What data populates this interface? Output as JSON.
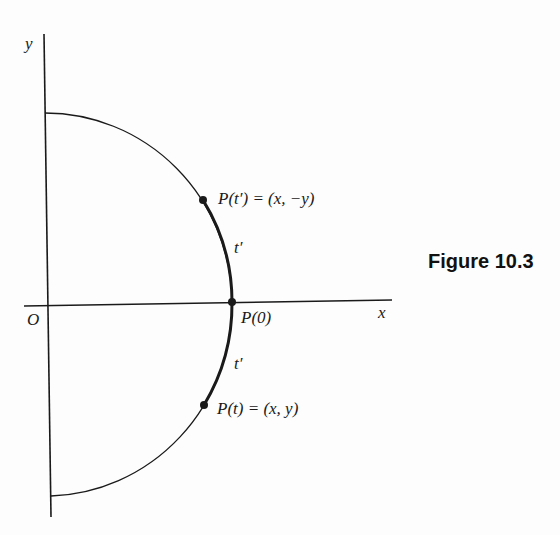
{
  "figure": {
    "caption": "Figure 10.3",
    "axes": {
      "x_label": "x",
      "y_label": "y",
      "origin_label": "O"
    },
    "points": [
      {
        "id": "p-t-prime",
        "label": "P(t′) = (x, −y)"
      },
      {
        "id": "p-zero",
        "label": "P(0)"
      },
      {
        "id": "p-t",
        "label": "P(t) = (x, y)"
      }
    ],
    "arc_labels": {
      "upper": "t′",
      "lower": "t′"
    },
    "colors": {
      "ink": "#1a1a1a",
      "background": "#fdfdfd"
    }
  }
}
